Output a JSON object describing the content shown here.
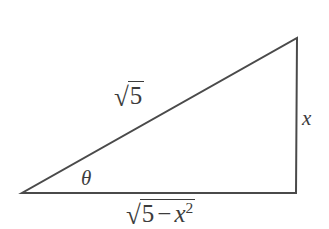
{
  "figure": {
    "kind": "right-triangle-diagram",
    "background_color": "#ffffff",
    "stroke_color": "#4a4a4a",
    "text_color": "#3c3c3c",
    "stroke_width": 2,
    "width": 329,
    "height": 229
  },
  "geometry": {
    "vertices": {
      "left": {
        "x": 22,
        "y": 193
      },
      "bottom_right": {
        "x": 296,
        "y": 193
      },
      "top_right": {
        "x": 297,
        "y": 38
      }
    },
    "right_angle_at": "bottom_right",
    "polygon_points": "22,193 296,193 297,38"
  },
  "labels": {
    "hypotenuse": {
      "radical_sign": "√",
      "radicand": "5",
      "plain_text": "√5",
      "position": {
        "x": 137,
        "y": 97
      }
    },
    "opposite": {
      "text": "x",
      "plain_text": "x",
      "position": {
        "x": 308,
        "y": 119
      }
    },
    "angle": {
      "text": "θ",
      "plain_text": "θ",
      "position": {
        "x": 88,
        "y": 180
      }
    },
    "adjacent": {
      "radical_sign": "√",
      "radicand_first": "5",
      "radicand_operator": "−",
      "radicand_variable": "x",
      "radicand_exponent": "2",
      "plain_text": "√(5 − x²)",
      "position": {
        "x": 166,
        "y": 214
      }
    }
  }
}
